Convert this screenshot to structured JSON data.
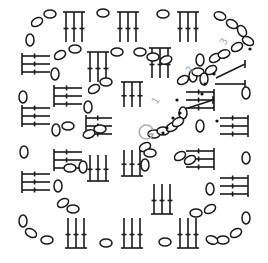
{
  "diagram": {
    "title": "Crochet granny square chart",
    "width": 268,
    "height": 263,
    "colors": {
      "ink": "#1a1a1a",
      "label": "#a8a8a8",
      "background": "#ffffff"
    },
    "round_labels": [
      {
        "text": "1",
        "x": 157,
        "y": 105,
        "rotate": -60
      },
      {
        "text": "2",
        "x": 191,
        "y": 74,
        "rotate": -60
      },
      {
        "text": "3",
        "x": 225,
        "y": 46,
        "rotate": -60
      }
    ],
    "start_symbol": {
      "label": "G",
      "cx": 146,
      "cy": 132,
      "r": 7
    },
    "slip_dots": [
      [
        163,
        133
      ],
      [
        167,
        128
      ],
      [
        173,
        118
      ],
      [
        180,
        113
      ],
      [
        202,
        94
      ],
      [
        205,
        84
      ],
      [
        214,
        74
      ],
      [
        250,
        49
      ],
      [
        177,
        100
      ],
      [
        217,
        121
      ]
    ],
    "clusters_vertical": [
      {
        "x": 66,
        "y": 12,
        "h": 30,
        "dir": "down"
      },
      {
        "x": 120,
        "y": 12,
        "h": 30,
        "dir": "down"
      },
      {
        "x": 180,
        "y": 12,
        "h": 30,
        "dir": "down"
      },
      {
        "x": 90,
        "y": 52,
        "h": 30,
        "dir": "down"
      },
      {
        "x": 152,
        "y": 48,
        "h": 30,
        "dir": "down"
      },
      {
        "x": 124,
        "y": 82,
        "h": 25,
        "dir": "down"
      },
      {
        "x": 90,
        "y": 155,
        "h": 26,
        "dir": "up"
      },
      {
        "x": 154,
        "y": 184,
        "h": 30,
        "dir": "up"
      },
      {
        "x": 68,
        "y": 218,
        "h": 30,
        "dir": "up"
      },
      {
        "x": 124,
        "y": 218,
        "h": 30,
        "dir": "up"
      },
      {
        "x": 180,
        "y": 218,
        "h": 30,
        "dir": "up"
      },
      {
        "x": 124,
        "y": 150,
        "h": 26,
        "dir": "up"
      }
    ],
    "clusters_horizontal": [
      {
        "x": 22,
        "y": 56,
        "w": 28,
        "dir": "right"
      },
      {
        "x": 22,
        "y": 108,
        "w": 28,
        "dir": "right"
      },
      {
        "x": 22,
        "y": 174,
        "w": 28,
        "dir": "right"
      },
      {
        "x": 54,
        "y": 88,
        "w": 28,
        "dir": "right"
      },
      {
        "x": 54,
        "y": 152,
        "w": 28,
        "dir": "right"
      },
      {
        "x": 86,
        "y": 118,
        "w": 26,
        "dir": "right"
      },
      {
        "x": 186,
        "y": 151,
        "w": 28,
        "dir": "left"
      },
      {
        "x": 220,
        "y": 118,
        "w": 28,
        "dir": "left"
      },
      {
        "x": 220,
        "y": 178,
        "w": 28,
        "dir": "left"
      },
      {
        "x": 186,
        "y": 92,
        "w": 28,
        "dir": "left"
      }
    ],
    "chain_ovals": [
      [
        50,
        14,
        0
      ],
      [
        37,
        22,
        -30
      ],
      [
        30,
        40,
        90
      ],
      [
        103,
        13,
        0
      ],
      [
        163,
        14,
        0
      ],
      [
        220,
        16,
        20
      ],
      [
        232,
        24,
        30
      ],
      [
        242,
        31,
        60
      ],
      [
        248,
        41,
        30
      ],
      [
        60,
        55,
        -30
      ],
      [
        75,
        49,
        0
      ],
      [
        55,
        74,
        90
      ],
      [
        140,
        52,
        0
      ],
      [
        117,
        52,
        0
      ],
      [
        23,
        97,
        90
      ],
      [
        106,
        82,
        0
      ],
      [
        94,
        89,
        -30
      ],
      [
        88,
        107,
        90
      ],
      [
        215,
        58,
        -30
      ],
      [
        224,
        54,
        -20
      ],
      [
        237,
        47,
        -30
      ],
      [
        24,
        152,
        90
      ],
      [
        56,
        130,
        90
      ],
      [
        68,
        126,
        0
      ],
      [
        183,
        113,
        90
      ],
      [
        153,
        57,
        0
      ],
      [
        166,
        60,
        -20
      ],
      [
        83,
        167,
        90
      ],
      [
        89,
        134,
        -20
      ],
      [
        100,
        129,
        0
      ],
      [
        180,
        156,
        -30
      ],
      [
        190,
        160,
        -30
      ],
      [
        23,
        221,
        90
      ],
      [
        58,
        186,
        90
      ],
      [
        63,
        203,
        -30
      ],
      [
        73,
        209,
        0
      ],
      [
        154,
        134,
        0
      ],
      [
        163,
        131,
        0
      ],
      [
        172,
        127,
        -30
      ],
      [
        178,
        122,
        -30
      ],
      [
        183,
        80,
        -30
      ],
      [
        193,
        76,
        90
      ],
      [
        198,
        72,
        0
      ],
      [
        204,
        79,
        90
      ],
      [
        211,
        70,
        -30
      ],
      [
        31,
        233,
        30
      ],
      [
        47,
        240,
        0
      ],
      [
        106,
        243,
        0
      ],
      [
        165,
        242,
        0
      ],
      [
        223,
        240,
        0
      ],
      [
        236,
        233,
        -30
      ],
      [
        246,
        218,
        90
      ],
      [
        246,
        158,
        90
      ],
      [
        246,
        93,
        90
      ],
      [
        210,
        189,
        90
      ],
      [
        210,
        209,
        -30
      ],
      [
        196,
        213,
        0
      ],
      [
        200,
        60,
        90
      ],
      [
        200,
        126,
        90
      ],
      [
        145,
        147,
        -30
      ],
      [
        150,
        153,
        0
      ],
      [
        145,
        165,
        90
      ],
      [
        70,
        168,
        0
      ],
      [
        212,
        240,
        20
      ]
    ],
    "corner_lines": [
      {
        "x1": 216,
        "y1": 78,
        "x2": 245,
        "y2": 64
      },
      {
        "x1": 215,
        "y1": 84,
        "x2": 245,
        "y2": 84
      },
      {
        "x1": 188,
        "y1": 108,
        "x2": 213,
        "y2": 100
      }
    ]
  }
}
